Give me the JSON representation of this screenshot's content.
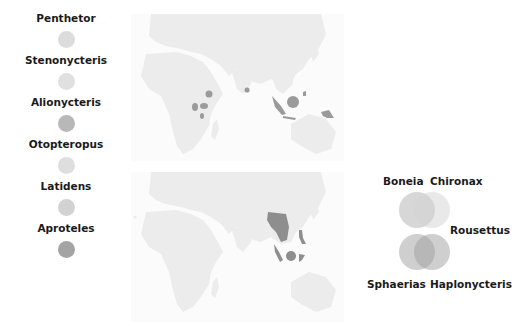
{
  "legend": {
    "items": [
      {
        "label": "Penthetor",
        "color": "#dcdcdc"
      },
      {
        "label": "Stenonycteris",
        "color": "#e0e0e0"
      },
      {
        "label": "Alionycteris",
        "color": "#b8b8b8"
      },
      {
        "label": "Otopteropus",
        "color": "#dedede"
      },
      {
        "label": "Latidens",
        "color": "#d2d2d2"
      },
      {
        "label": "Aproteles",
        "color": "#a4a4a4"
      }
    ]
  },
  "maps": [
    {
      "name": "top-map",
      "land_color": "#ececec",
      "highlight_color": "#9a9a9a",
      "highlight_regions": [
        "east-africa",
        "sri-lanka",
        "sumatra",
        "borneo",
        "philippines",
        "new-guinea"
      ]
    },
    {
      "name": "bottom-map",
      "land_color": "#ececec",
      "highlight_color": "#8e8e8e",
      "highlight_regions": [
        "indochina",
        "malay-peninsula",
        "borneo",
        "sulawesi",
        "philippines"
      ]
    }
  ],
  "venn": {
    "labels": {
      "top_left": "Boneia",
      "top_right": "Chironax",
      "middle_right": "Rousettus",
      "bottom_left": "Sphaerias",
      "bottom_right": "Haplonycteris"
    }
  }
}
